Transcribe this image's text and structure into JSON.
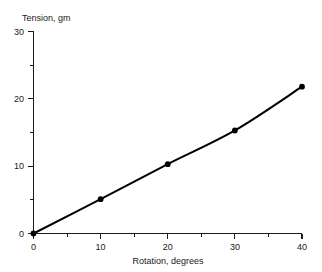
{
  "chart_data": {
    "type": "line",
    "title": "",
    "xlabel": "Rotation, degrees",
    "ylabel": "Tension, gm",
    "x": [
      0,
      10,
      20,
      30,
      40
    ],
    "values": [
      0,
      5.1,
      10.3,
      15.3,
      21.8
    ],
    "series": [
      {
        "name": "Tension",
        "x": [
          0,
          10,
          20,
          30,
          40
        ],
        "values": [
          0,
          5.1,
          10.3,
          15.3,
          21.8
        ]
      }
    ],
    "xlim": [
      0,
      40
    ],
    "ylim": [
      0,
      30
    ],
    "x_ticks": [
      0,
      10,
      20,
      30,
      40
    ],
    "x_tick_labels": [
      "0",
      "10",
      "20",
      "30",
      "40"
    ],
    "x_minor_ticks": [
      5,
      15,
      25,
      35
    ],
    "y_ticks": [
      0,
      10,
      20,
      30
    ],
    "y_tick_labels": [
      "0",
      "10",
      "20",
      "30"
    ],
    "y_minor_ticks": [
      5,
      15,
      25
    ],
    "grid": false,
    "legend": null,
    "marker": "filled-circle",
    "line_color": "#000000",
    "marker_color": "#000000",
    "background_color": "#ffffff",
    "axis_color": "#1a1a1a"
  },
  "axes": {
    "y_title": "Tension, gm",
    "x_title": "Rotation, degrees",
    "y_labels": {
      "t30": "30",
      "t20": "20",
      "t10": "10",
      "t0": "0"
    },
    "x_labels": {
      "t0": "0",
      "t10": "10",
      "t20": "20",
      "t30": "30",
      "t40": "40"
    }
  }
}
